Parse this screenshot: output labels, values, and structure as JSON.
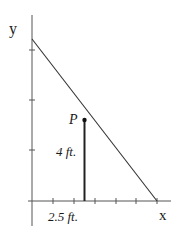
{
  "diagram": {
    "type": "coordinate-geometry",
    "axes": {
      "x_label": "x",
      "y_label": "y",
      "x_ticks_count": 6,
      "y_ticks_count": 3
    },
    "point": {
      "label": "P",
      "height_label": "4 ft.",
      "distance_label": "2.5 ft."
    },
    "line": {
      "description": "line from y-axis intercept down to x-axis intercept"
    },
    "colors": {
      "stroke": "#333333",
      "background": "#ffffff"
    }
  }
}
